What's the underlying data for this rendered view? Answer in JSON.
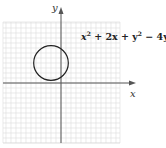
{
  "chart_data": {
    "type": "line",
    "title": "",
    "equation": "x^2 + 2x + y^2 - 4y + 2 = 0",
    "equation_parts": [
      "x",
      "2",
      " + 2x + y",
      "2",
      " − 4y + 2 = 0"
    ],
    "xlabel": "x",
    "ylabel": "y",
    "grid": true,
    "xlim": [
      -6,
      6
    ],
    "ylim": [
      -6,
      6
    ],
    "circle": {
      "center": [
        -1,
        2
      ],
      "radius": 1.732
    },
    "colors": {
      "grid": "#dcdcdc",
      "axis": "#555555",
      "curve": "#222222"
    }
  }
}
